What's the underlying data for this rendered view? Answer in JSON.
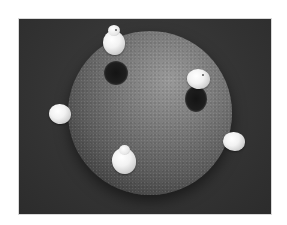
{
  "scene": {
    "description": "Rendered grayscale sphere with textured surface and five white duck-like figures on it, casting shadows, on a dark background",
    "colors": {
      "background_page": "#ffffff",
      "backdrop": "#353535",
      "sphere_light": "#9a9a9a",
      "sphere_dark": "#2a2a2a",
      "figure": "#f2f2f2",
      "shadow": "#141414"
    },
    "figures": [
      {
        "name": "top",
        "x": 113,
        "y": 42
      },
      {
        "name": "right",
        "x": 200,
        "y": 78
      },
      {
        "name": "left",
        "x": 60,
        "y": 115
      },
      {
        "name": "bottom",
        "x": 125,
        "y": 160
      },
      {
        "name": "far-right",
        "x": 235,
        "y": 143
      }
    ]
  }
}
